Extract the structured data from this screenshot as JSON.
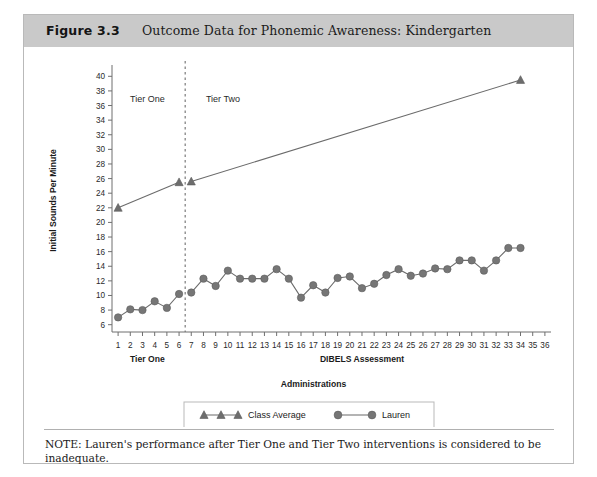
{
  "figure": {
    "number": "Figure 3.3",
    "title": "Outcome Data for Phonemic Awareness: Kindergarten",
    "note": "NOTE: Lauren's performance after Tier One and Tier Two interventions is considered to be inadequate."
  },
  "colors": {
    "header_band": "#c9c9c9",
    "series_gray": "#6f6f6f",
    "marker_fill": "#767676",
    "border": "#b9b9b9",
    "text": "#1b1b1b"
  },
  "legend": {
    "items": [
      {
        "label": "Class Average",
        "marker": "triangle"
      },
      {
        "label": "Lauren",
        "marker": "circle"
      }
    ]
  },
  "annotations": [
    {
      "label": "Tier One",
      "x": 3.4,
      "y": 36.5
    },
    {
      "label": "Tier Two",
      "x": 9.6,
      "y": 36.5
    }
  ],
  "phase_divider_x": 6.5,
  "chart_data": {
    "type": "line",
    "title": "Outcome Data for Phonemic Awareness: Kindergarten",
    "xlabel": "DIBELS Assessment",
    "xlabel_secondary": "Administrations",
    "xlabel_phase": "Tier One",
    "ylabel": "Initial Sounds Per Minute",
    "xlim": [
      0.5,
      36.5
    ],
    "ylim": [
      5,
      41
    ],
    "yticks": [
      6,
      8,
      10,
      12,
      14,
      16,
      18,
      20,
      22,
      24,
      26,
      28,
      30,
      32,
      34,
      36,
      38,
      40
    ],
    "xticks": [
      1,
      2,
      3,
      4,
      5,
      6,
      7,
      8,
      9,
      10,
      11,
      12,
      13,
      14,
      15,
      16,
      17,
      18,
      19,
      20,
      21,
      22,
      23,
      24,
      25,
      26,
      27,
      28,
      29,
      30,
      31,
      32,
      33,
      34,
      35,
      36
    ],
    "grid": false,
    "legend_position": "bottom",
    "series": [
      {
        "name": "Class Average",
        "marker": "triangle",
        "segments": [
          {
            "x": [
              1,
              6
            ],
            "values": [
              22.0,
              25.5
            ]
          },
          {
            "x": [
              7,
              34
            ],
            "values": [
              25.6,
              39.5
            ]
          }
        ]
      },
      {
        "name": "Lauren",
        "marker": "circle",
        "segments": [
          {
            "x": [
              1,
              2,
              3,
              4,
              5,
              6
            ],
            "values": [
              7.0,
              8.1,
              8.0,
              9.2,
              8.3,
              10.2
            ]
          },
          {
            "x": [
              7,
              8,
              9,
              10,
              11,
              12,
              13,
              14,
              15,
              16,
              17,
              18,
              19,
              20,
              21,
              22,
              23,
              24,
              25,
              26,
              27,
              28,
              29,
              30,
              31,
              32,
              33,
              34
            ],
            "values": [
              10.4,
              12.3,
              11.3,
              13.4,
              12.3,
              12.3,
              12.3,
              13.6,
              12.3,
              9.7,
              11.4,
              10.4,
              12.4,
              12.6,
              11.0,
              11.6,
              12.8,
              13.6,
              12.7,
              13.0,
              13.7,
              13.6,
              14.8,
              14.8,
              13.4,
              14.8,
              16.5,
              16.5
            ]
          }
        ]
      }
    ]
  }
}
